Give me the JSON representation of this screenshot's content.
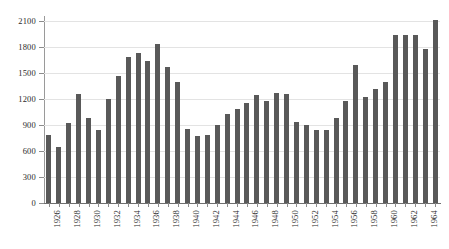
{
  "chart_data": {
    "type": "bar",
    "title": "",
    "subtitle": "",
    "xlabel": "",
    "ylabel": "",
    "grid": true,
    "legend": false,
    "legend_position": "none",
    "bar_color": "#595959",
    "grid_color": "#e3e3e3",
    "axis_color": "#8c8c8c",
    "ylim": [
      0,
      2100
    ],
    "yticks": [
      0,
      300,
      600,
      900,
      1200,
      1500,
      1800,
      2100
    ],
    "ytick_labels": [
      "0",
      "300",
      "600",
      "900",
      "1200",
      "1500",
      "1800",
      "2100"
    ],
    "xlim_categories": [
      "1926",
      "1965"
    ],
    "xtick_labels": [
      "1926",
      "1928",
      "1930",
      "1932",
      "1934",
      "1936",
      "1938",
      "1940",
      "1942",
      "1944",
      "1946",
      "1948",
      "1950",
      "1952",
      "1954",
      "1956",
      "1958",
      "1960",
      "1962",
      "1964"
    ],
    "xtick_label_interval": 2,
    "categories": [
      "1926",
      "1927",
      "1928",
      "1929",
      "1930",
      "1931",
      "1932",
      "1933",
      "1934",
      "1935",
      "1936",
      "1937",
      "1938",
      "1939",
      "1940",
      "1941",
      "1942",
      "1943",
      "1944",
      "1945",
      "1946",
      "1947",
      "1948",
      "1949",
      "1950",
      "1951",
      "1952",
      "1953",
      "1954",
      "1955",
      "1956",
      "1957",
      "1958",
      "1959",
      "1960",
      "1961",
      "1962",
      "1963",
      "1964",
      "1965"
    ],
    "values": [
      790,
      650,
      920,
      1260,
      980,
      840,
      1200,
      1460,
      1680,
      1730,
      1640,
      1830,
      1570,
      1400,
      850,
      770,
      790,
      900,
      1030,
      1090,
      1150,
      1250,
      1180,
      1270,
      1260,
      930,
      900,
      840,
      840,
      980,
      1180,
      1590,
      1220,
      1320,
      1400,
      1940,
      1940,
      1940,
      1780,
      2110
    ]
  }
}
